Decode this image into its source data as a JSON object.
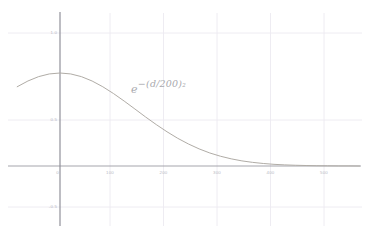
{
  "chart_data": {
    "type": "line",
    "title": "",
    "subtitle": "",
    "xlabel": "",
    "ylabel": "",
    "xlim": [
      -100,
      560
    ],
    "ylim": [
      -0.62,
      1.12
    ],
    "grid": true,
    "legend": "none",
    "annotations": [
      {
        "name": "curve-equation",
        "text": "e^-(d/200)^2",
        "base": "e",
        "exponent": "−(d/200)",
        "exponent_power": "2",
        "x": 210,
        "y": 0.8
      }
    ],
    "x_ticks": [
      {
        "value": 0,
        "label": "0"
      },
      {
        "value": 100,
        "label": "100"
      },
      {
        "value": 200,
        "label": "200"
      },
      {
        "value": 300,
        "label": "300"
      },
      {
        "value": 400,
        "label": "400"
      },
      {
        "value": 500,
        "label": "500"
      }
    ],
    "y_ticks": [
      {
        "value": 1.0,
        "label": "1.0"
      },
      {
        "value": 0.5,
        "label": "0.5"
      },
      {
        "value": -0.5,
        "label": "-0.5"
      }
    ],
    "series": [
      {
        "name": "gaussian-falloff",
        "formula": "exp(-(d/200)^2)",
        "color": "#b0aca6",
        "x": [
          -100,
          -80,
          -60,
          -40,
          -20,
          0,
          20,
          40,
          60,
          80,
          100,
          120,
          140,
          160,
          180,
          200,
          220,
          240,
          260,
          280,
          300,
          320,
          340,
          360,
          380,
          400,
          420,
          440,
          460,
          480,
          500,
          520,
          540,
          560
        ],
        "values": [
          0.779,
          0.852,
          0.914,
          0.961,
          0.99,
          1.0,
          0.99,
          0.961,
          0.914,
          0.852,
          0.779,
          0.698,
          0.613,
          0.527,
          0.445,
          0.368,
          0.298,
          0.237,
          0.184,
          0.14,
          0.105,
          0.077,
          0.055,
          0.039,
          0.027,
          0.018,
          0.012,
          0.008,
          0.005,
          0.003,
          0.002,
          0.001,
          0.001,
          0.0
        ]
      }
    ],
    "axis_color": "#8a8a93",
    "grid_color": "#ededf3",
    "tick_label_color": "#b9b9c4",
    "background_color": "#ffffff"
  }
}
